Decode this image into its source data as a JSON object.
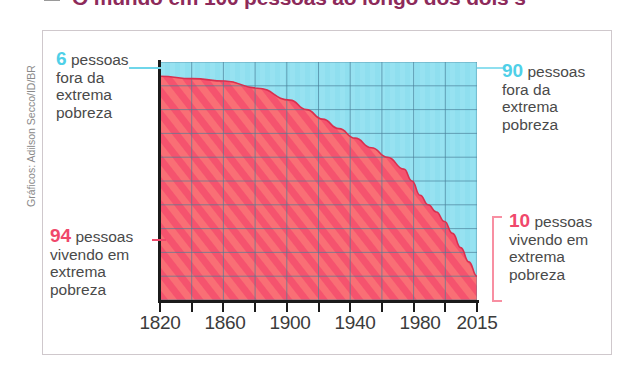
{
  "title": {
    "bullet": "square-bullet",
    "text": "O mundo em 100 pessoas ao longo dos dois s"
  },
  "credit": "Gráficos: Adilson Secco/ID/BR",
  "annotations": {
    "top_left": {
      "number": "6",
      "color": "#4fd0e8",
      "lines": [
        "pessoas",
        "fora da",
        "extrema",
        "pobreza"
      ]
    },
    "bottom_left": {
      "number": "94",
      "color": "#f0486b",
      "lines": [
        "pessoas",
        "vivendo em",
        "extrema",
        "pobreza"
      ]
    },
    "top_right": {
      "number": "90",
      "color": "#4fd0e8",
      "lines": [
        "pessoas",
        "fora da",
        "extrema",
        "pobreza"
      ]
    },
    "bottom_right": {
      "number": "10",
      "color": "#f0486b",
      "lines": [
        "pessoas",
        "vivendo em",
        "extrema",
        "pobreza"
      ]
    }
  },
  "axis": {
    "tick_labels": [
      "1820",
      "1860",
      "1900",
      "1940",
      "1980",
      "2015"
    ]
  },
  "colors": {
    "poverty_fill": "#f5536e",
    "poverty_fill_light": "#fb7a78",
    "non_poverty_fill": "#8fdfef",
    "grid": "#4a7f99",
    "axis": "#1b1b1b",
    "frame": "#cfc8cc",
    "text": "#4a4a4a",
    "title": "#8d2a5a"
  },
  "chart_data": {
    "type": "area",
    "xlabel": "",
    "ylabel": "",
    "xlim": [
      1820,
      2015
    ],
    "ylim": [
      0,
      100
    ],
    "grid": true,
    "legend": "none",
    "x_ticks": [
      1820,
      1860,
      1900,
      1940,
      1980,
      2015
    ],
    "x": [
      1820,
      1840,
      1860,
      1880,
      1900,
      1910,
      1920,
      1930,
      1940,
      1950,
      1960,
      1970,
      1975,
      1980,
      1985,
      1990,
      1995,
      2000,
      2005,
      2010,
      2015
    ],
    "series": [
      {
        "name": "pessoas vivendo em extrema pobreza",
        "color": "#f5536e",
        "values": [
          94,
          93,
          92,
          89,
          84,
          80,
          76,
          72,
          68,
          64,
          60,
          55,
          50,
          44,
          40,
          37,
          33,
          28,
          22,
          16,
          10
        ]
      },
      {
        "name": "pessoas fora da extrema pobreza",
        "color": "#8fdfef",
        "values": [
          6,
          7,
          8,
          11,
          16,
          20,
          24,
          28,
          32,
          36,
          40,
          45,
          50,
          56,
          60,
          63,
          67,
          72,
          78,
          84,
          90
        ]
      }
    ],
    "endpoints": {
      "start_year": 1820,
      "start_poverty": 94,
      "start_non_poverty": 6,
      "end_year": 2015,
      "end_poverty": 10,
      "end_non_poverty": 90
    }
  }
}
